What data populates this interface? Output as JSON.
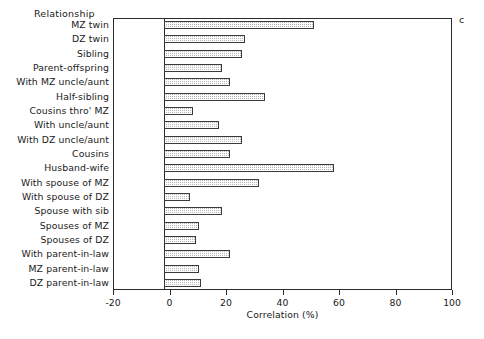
{
  "figure": {
    "panel_letter": "c",
    "category_axis_title": "Relationship",
    "xlabel": "Correlation (%)"
  },
  "chart_data": {
    "type": "bar",
    "orientation": "horizontal",
    "title": "",
    "subtitle": "",
    "panel_label": "c",
    "xlabel": "Correlation (%)",
    "ylabel": "Relationship",
    "xlim": [
      -20,
      100
    ],
    "xticks": [
      -20,
      0,
      20,
      40,
      60,
      80,
      100
    ],
    "xticklabels": [
      "-20",
      "0",
      "20",
      "40",
      "60",
      "80",
      "100"
    ],
    "grid": false,
    "legend": false,
    "zero_reference_line": 0,
    "categories": [
      "MZ twin",
      "DZ twin",
      "Sibling",
      "Parent-offspring",
      "With MZ uncle/aunt",
      "Half-sibling",
      "Cousins thro' MZ",
      "With uncle/aunt",
      "With DZ uncle/aunt",
      "Cousins",
      "Husband-wife",
      "With spouse of MZ",
      "With spouse of DZ",
      "Spouse with sib",
      "Spouses of MZ",
      "Spouses of DZ",
      "With parent-in-law",
      "MZ parent-in-law",
      "DZ parent-in-law"
    ],
    "values": [
      52,
      28,
      27,
      20,
      23,
      35,
      10,
      19,
      27,
      23,
      59,
      33,
      9,
      20,
      12,
      11,
      23,
      12,
      13
    ],
    "bar_style": {
      "fill": "#b8b8b8",
      "hatch": "dotted-cross",
      "edge": "#3a3a3a"
    }
  }
}
